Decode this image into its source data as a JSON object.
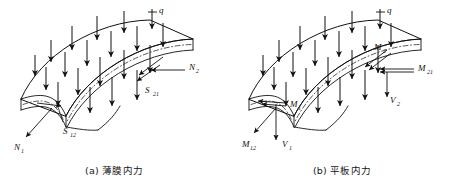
{
  "figure": {
    "background": "#ffffff",
    "ink": "#111111",
    "type": "engineering-diagram"
  },
  "panels": [
    {
      "id": "a",
      "caption": "(a) 薄膜内力",
      "load_label": "q",
      "labels": [
        {
          "name": "load-q",
          "base": "q",
          "sub": ""
        },
        {
          "name": "force-n2",
          "base": "N",
          "sub": "2"
        },
        {
          "name": "shear-s21",
          "base": "S",
          "sub": "21"
        },
        {
          "name": "shear-s12",
          "base": "S",
          "sub": "12"
        },
        {
          "name": "force-n1",
          "base": "N",
          "sub": "1"
        }
      ]
    },
    {
      "id": "b",
      "caption": "(b) 平板内力",
      "load_label": "q",
      "labels": [
        {
          "name": "load-q",
          "base": "q",
          "sub": ""
        },
        {
          "name": "moment-m2",
          "base": "M",
          "sub": "2"
        },
        {
          "name": "moment-m21",
          "base": "M",
          "sub": "21"
        },
        {
          "name": "shear-v2",
          "base": "V",
          "sub": "2"
        },
        {
          "name": "moment-m1",
          "base": "M",
          "sub": "1"
        },
        {
          "name": "moment-m12",
          "base": "M",
          "sub": "12"
        },
        {
          "name": "shear-v1",
          "base": "V",
          "sub": "1"
        }
      ]
    }
  ]
}
